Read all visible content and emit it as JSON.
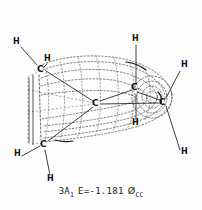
{
  "figure": {
    "kind": "molecular-orbital-isosurface-diagram",
    "background_color": "#fdfdfd",
    "line_color": "#333333",
    "dotted_color": "#555555",
    "label_color": "#111111"
  },
  "caption": {
    "state_term": "3A",
    "state_subscript": "1",
    "energy_label": "E=-1.181",
    "energy_value": -1.181,
    "unit_symbol": "Ø",
    "unit_subscript": "CC",
    "full_text": "3A1 E=-1.181 ØCC"
  },
  "atoms": [
    {
      "id": "h-upper-left",
      "element": "H",
      "x": 14,
      "y": 41
    },
    {
      "id": "h-upper-inner",
      "element": "H",
      "x": 45,
      "y": 58
    },
    {
      "id": "c-upper-left",
      "element": "C",
      "x": 38,
      "y": 69
    },
    {
      "id": "h-top-right",
      "element": "H",
      "x": 133,
      "y": 38
    },
    {
      "id": "h-right-upper",
      "element": "H",
      "x": 182,
      "y": 64
    },
    {
      "id": "c-right-mid",
      "element": "C",
      "x": 132,
      "y": 86
    },
    {
      "id": "c-center",
      "element": "C",
      "x": 93,
      "y": 102
    },
    {
      "id": "c-far-right",
      "element": "C",
      "x": 161,
      "y": 101
    },
    {
      "id": "h-center-lower",
      "element": "H",
      "x": 133,
      "y": 122
    },
    {
      "id": "h-right-lower",
      "element": "H",
      "x": 182,
      "y": 151
    },
    {
      "id": "c-lower-left",
      "element": "C",
      "x": 41,
      "y": 143
    },
    {
      "id": "h-lower-left",
      "element": "H",
      "x": 15,
      "y": 153
    },
    {
      "id": "h-bottom",
      "element": "H",
      "x": 48,
      "y": 178
    }
  ],
  "bonds": [
    {
      "from": "h-upper-left",
      "to": "c-upper-left",
      "style": "solid"
    },
    {
      "from": "h-upper-inner",
      "to": "c-upper-left",
      "style": "solid"
    },
    {
      "from": "h-top-right",
      "to": "c-right-mid",
      "style": "solid"
    },
    {
      "from": "h-right-upper",
      "to": "c-far-right",
      "style": "solid"
    },
    {
      "from": "h-center-lower",
      "to": "c-right-mid",
      "style": "solid"
    },
    {
      "from": "h-right-lower",
      "to": "c-far-right",
      "style": "solid"
    },
    {
      "from": "h-lower-left",
      "to": "c-lower-left",
      "style": "solid"
    },
    {
      "from": "h-bottom",
      "to": "c-lower-left",
      "style": "solid"
    },
    {
      "from": "c-upper-left",
      "to": "c-center",
      "style": "solid"
    },
    {
      "from": "c-center",
      "to": "c-right-mid",
      "style": "solid"
    },
    {
      "from": "c-right-mid",
      "to": "c-far-right",
      "style": "solid"
    },
    {
      "from": "c-center",
      "to": "c-far-right",
      "style": "solid"
    },
    {
      "from": "c-center",
      "to": "c-lower-left",
      "style": "solid"
    },
    {
      "from": "c-upper-left",
      "to": "c-lower-left",
      "style": "solid"
    }
  ],
  "isosurface": {
    "description": "dotted contour lobes enclosing the carbon skeleton",
    "lobe_count": 2,
    "render_style": "dashed"
  }
}
